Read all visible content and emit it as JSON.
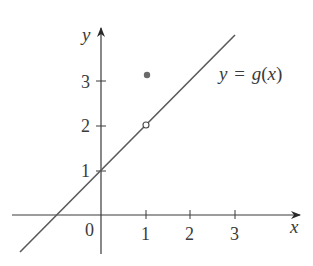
{
  "figure": {
    "type": "function-graph",
    "function_label": "y = g(x)",
    "function_label_parts": {
      "y": "y",
      "eq": "=",
      "g": "g",
      "lp": "(",
      "x": "x",
      "rp": ")"
    },
    "axes": {
      "x_label": "x",
      "y_label": "y",
      "origin_label": "0",
      "x_ticks": [
        "1",
        "2",
        "3"
      ],
      "y_ticks": [
        "1",
        "2",
        "3"
      ]
    },
    "line": {
      "slope": 1,
      "intercept": 1,
      "description": "y = x + 1"
    },
    "open_point": {
      "x": 1,
      "y": 2
    },
    "filled_point": {
      "x": 1,
      "y": 3
    },
    "colors": {
      "axis": "#3a3a3a",
      "line": "#5a5a5a",
      "dot": "#6a6a6a"
    }
  }
}
